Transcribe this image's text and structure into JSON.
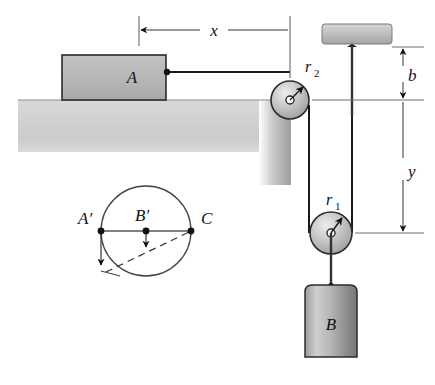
{
  "figure": {
    "background_color": "#ffffff",
    "line_color": "#111111",
    "block_fill": "#b8b8b8",
    "ledge_fill": "#cfcfcf",
    "pulley_fill": "#c9c9c9"
  },
  "labels": {
    "block_a": "A",
    "block_b": "B",
    "pulley_upper": "r",
    "pulley_upper_sub": "2",
    "pulley_lower": "r",
    "pulley_lower_sub": "1",
    "dim_x": "x",
    "dim_b": "b",
    "dim_y": "y",
    "point_a_prime": "A′",
    "point_b_prime": "B′",
    "point_c": "C"
  },
  "dimensions": {
    "x": {
      "name": "x",
      "orientation": "horizontal",
      "from_px": [
        139,
        30
      ],
      "to_px": [
        290,
        30
      ],
      "label_px": [
        214,
        28
      ]
    },
    "b": {
      "name": "b",
      "orientation": "vertical",
      "from_px": [
        403,
        47
      ],
      "to_px": [
        403,
        100
      ],
      "label_px": [
        412,
        76
      ]
    },
    "y": {
      "name": "y",
      "orientation": "vertical",
      "from_px": [
        403,
        100
      ],
      "to_px": [
        403,
        233
      ],
      "label_px": [
        412,
        170
      ]
    }
  },
  "parts": {
    "ledge": {
      "name": "ledge",
      "top_surface_y": 100,
      "left_x": 18,
      "right_x": 291,
      "bottom_y": 152,
      "drop_bottom_y": 185
    },
    "block_a": {
      "name": "block-a",
      "x": 62,
      "y": 55,
      "width": 104,
      "height": 45
    },
    "block_b": {
      "name": "block-b",
      "x": 305,
      "y": 285,
      "width": 52,
      "height": 72
    },
    "ceiling_bracket": {
      "name": "ceiling-bracket",
      "x": 322,
      "y": 24,
      "width": 70,
      "height": 20
    },
    "pulley_upper": {
      "name": "pulley-r2",
      "center": [
        290,
        100
      ],
      "radius": 19
    },
    "pulley_lower": {
      "name": "pulley-r1",
      "center": [
        331,
        233
      ],
      "radius": 21
    },
    "support_rod": {
      "name": "support-rod",
      "from_px": [
        352,
        44
      ],
      "to_px": [
        352,
        368
      ]
    }
  },
  "circle_diagram": {
    "name": "velocity-circle-diagram",
    "center": [
      146,
      231
    ],
    "radius": 45,
    "points": [
      {
        "name": "A-prime",
        "label": "A′",
        "at_px": [
          101,
          231
        ],
        "label_px": [
          80,
          220
        ]
      },
      {
        "name": "B-prime",
        "label": "B′",
        "at_px": [
          146,
          231
        ],
        "label_px": [
          140,
          218
        ]
      },
      {
        "name": "C",
        "label": "C",
        "at_px": [
          191,
          231
        ],
        "label_px": [
          203,
          221
        ]
      }
    ],
    "arrows": [
      {
        "name": "arrow-at-a-prime",
        "from_px": [
          101,
          231
        ],
        "to_px": [
          101,
          267
        ]
      },
      {
        "name": "arrow-at-b-prime",
        "from_px": [
          146,
          231
        ],
        "to_px": [
          146,
          249
        ]
      }
    ],
    "dashed_chord": {
      "from_px": [
        106,
        272
      ],
      "to_px": [
        191,
        231
      ]
    },
    "connector": {
      "from_px": [
        101,
        267
      ],
      "to_px": [
        117,
        274
      ]
    }
  }
}
